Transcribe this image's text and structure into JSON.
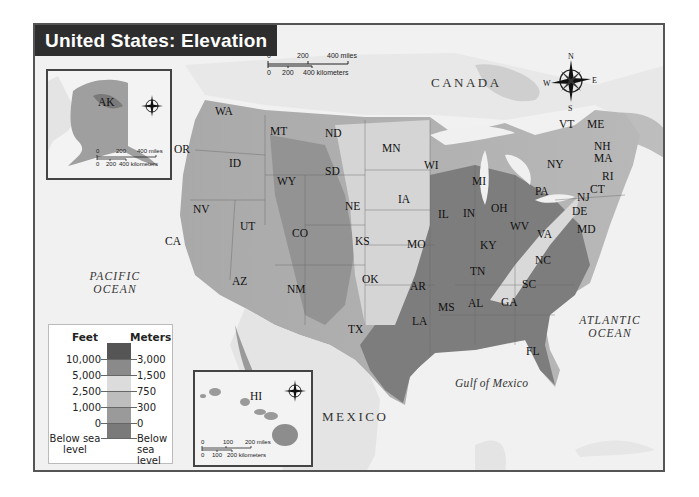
{
  "title": "United States: Elevation",
  "countries": {
    "canada": "CANADA",
    "mexico": "MEXICO"
  },
  "oceans": {
    "pacific": [
      "PACIFIC",
      "OCEAN"
    ],
    "atlantic": [
      "ATLANTIC",
      "OCEAN"
    ],
    "gulf": "Gulf of Mexico"
  },
  "states": [
    {
      "abbr": "WA",
      "x": 213,
      "y": 110
    },
    {
      "abbr": "OR",
      "x": 172,
      "y": 148
    },
    {
      "abbr": "ID",
      "x": 227,
      "y": 162
    },
    {
      "abbr": "MT",
      "x": 268,
      "y": 130
    },
    {
      "abbr": "WY",
      "x": 275,
      "y": 180
    },
    {
      "abbr": "NV",
      "x": 191,
      "y": 208
    },
    {
      "abbr": "CA",
      "x": 163,
      "y": 240
    },
    {
      "abbr": "UT",
      "x": 238,
      "y": 225
    },
    {
      "abbr": "CO",
      "x": 290,
      "y": 232
    },
    {
      "abbr": "AZ",
      "x": 230,
      "y": 280
    },
    {
      "abbr": "NM",
      "x": 285,
      "y": 288
    },
    {
      "abbr": "ND",
      "x": 323,
      "y": 132
    },
    {
      "abbr": "SD",
      "x": 323,
      "y": 170
    },
    {
      "abbr": "NE",
      "x": 343,
      "y": 205
    },
    {
      "abbr": "KS",
      "x": 353,
      "y": 240
    },
    {
      "abbr": "OK",
      "x": 360,
      "y": 278
    },
    {
      "abbr": "TX",
      "x": 346,
      "y": 328
    },
    {
      "abbr": "MN",
      "x": 380,
      "y": 147
    },
    {
      "abbr": "IA",
      "x": 396,
      "y": 198
    },
    {
      "abbr": "MO",
      "x": 405,
      "y": 243
    },
    {
      "abbr": "AR",
      "x": 408,
      "y": 285
    },
    {
      "abbr": "LA",
      "x": 410,
      "y": 320
    },
    {
      "abbr": "WI",
      "x": 422,
      "y": 164
    },
    {
      "abbr": "IL",
      "x": 436,
      "y": 213
    },
    {
      "abbr": "MS",
      "x": 436,
      "y": 306
    },
    {
      "abbr": "MI",
      "x": 470,
      "y": 180
    },
    {
      "abbr": "IN",
      "x": 461,
      "y": 212
    },
    {
      "abbr": "KY",
      "x": 478,
      "y": 244
    },
    {
      "abbr": "TN",
      "x": 468,
      "y": 270
    },
    {
      "abbr": "AL",
      "x": 466,
      "y": 302
    },
    {
      "abbr": "OH",
      "x": 489,
      "y": 207
    },
    {
      "abbr": "GA",
      "x": 499,
      "y": 301
    },
    {
      "abbr": "WV",
      "x": 508,
      "y": 225
    },
    {
      "abbr": "VA",
      "x": 535,
      "y": 233
    },
    {
      "abbr": "NC",
      "x": 533,
      "y": 259
    },
    {
      "abbr": "SC",
      "x": 520,
      "y": 283
    },
    {
      "abbr": "FL",
      "x": 524,
      "y": 350
    },
    {
      "abbr": "PA",
      "x": 533,
      "y": 190
    },
    {
      "abbr": "NY",
      "x": 545,
      "y": 163
    },
    {
      "abbr": "VT",
      "x": 557,
      "y": 123
    },
    {
      "abbr": "ME",
      "x": 585,
      "y": 123
    },
    {
      "abbr": "NH",
      "x": 592,
      "y": 145
    },
    {
      "abbr": "MA",
      "x": 592,
      "y": 157
    },
    {
      "abbr": "RI",
      "x": 600,
      "y": 175
    },
    {
      "abbr": "CT",
      "x": 588,
      "y": 188
    },
    {
      "abbr": "NJ",
      "x": 575,
      "y": 196
    },
    {
      "abbr": "DE",
      "x": 570,
      "y": 210
    },
    {
      "abbr": "MD",
      "x": 575,
      "y": 228
    }
  ],
  "main_scale": {
    "miles": [
      "0",
      "200",
      "400 miles"
    ],
    "km": [
      "0",
      "200",
      "400 kilometers"
    ]
  },
  "alaska_inset": {
    "label": "AK",
    "scale": {
      "miles": [
        "0",
        "200",
        "400 miles"
      ],
      "km": [
        "0",
        "200",
        "400 kilometers"
      ]
    }
  },
  "hawaii_inset": {
    "label": "HI",
    "scale": {
      "miles": [
        "0",
        "100",
        "200 miles"
      ],
      "km": [
        "0",
        "100",
        "200 kilometers"
      ]
    }
  },
  "compass": {
    "n": "N",
    "s": "S",
    "e": "E",
    "w": "W"
  },
  "legend": {
    "feet_header": "Feet",
    "meters_header": "Meters",
    "levels": [
      {
        "feet": "10,000",
        "meters": "3,000"
      },
      {
        "feet": "5,000",
        "meters": "1,500"
      },
      {
        "feet": "2,500",
        "meters": "750"
      },
      {
        "feet": "1,000",
        "meters": "300"
      },
      {
        "feet": "0",
        "meters": "0"
      }
    ],
    "below": {
      "feet": "Below sea level",
      "meters": "Below sea level"
    },
    "colors": [
      "#555555",
      "#8a8a8a",
      "#dcdcdc",
      "#bdbdbd",
      "#9a9a9a",
      "#7a7a7a"
    ]
  }
}
